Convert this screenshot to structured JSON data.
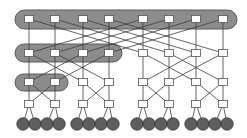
{
  "diagram": {
    "type": "fat-tree network topology",
    "colors": {
      "background": "#ffffff",
      "group_fill": "#8c8c8c",
      "group_stroke": "#5a5a5a",
      "switch_fill": "#ffffff",
      "switch_stroke": "#555555",
      "link": "#3c3c3c",
      "host_fill": "#5e5e5e",
      "host_stroke": "#333333"
    },
    "columns_x": [
      29,
      55,
      83,
      109,
      143,
      169,
      196,
      223
    ],
    "rows_y": [
      19,
      53,
      82,
      104
    ],
    "host_row_y": 124,
    "host_x": [
      23,
      35,
      47,
      59,
      77,
      89,
      101,
      113,
      137,
      149,
      161,
      173,
      191,
      203,
      215,
      227
    ],
    "groups": [
      {
        "name": "top-level-group",
        "x": 15,
        "y": 10,
        "w": 222,
        "h": 19
      },
      {
        "name": "second-level-group",
        "x": 15,
        "y": 44,
        "w": 107,
        "h": 18
      },
      {
        "name": "third-level-group",
        "x": 15,
        "y": 74,
        "w": 53,
        "h": 17
      }
    ],
    "layers": [
      {
        "name": "layer-1",
        "switch_count": 8
      },
      {
        "name": "layer-2",
        "switch_count": 8
      },
      {
        "name": "layer-3",
        "switch_count": 8
      },
      {
        "name": "layer-4",
        "switch_count": 8
      },
      {
        "name": "hosts",
        "host_count": 16
      }
    ]
  }
}
